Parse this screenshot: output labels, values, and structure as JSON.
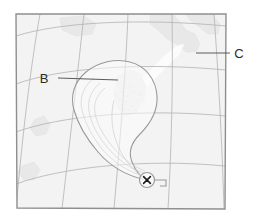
{
  "figure": {
    "kind": "tropical-cyclone-forecast-track-map",
    "width": 257,
    "height": 224,
    "background_color": "#ffffff"
  },
  "map": {
    "frame": {
      "corners": "16,14 226,14 225,209 17,208",
      "border_color": "#8f8f8f",
      "fill_color": "#f3f3f3"
    },
    "graticule": {
      "color": "#b0b0b0",
      "latitude_lines": 4,
      "longitude_lines": 5
    },
    "land": {
      "fill_color": "#e6e6e6",
      "stroke_color": "#dddddd"
    }
  },
  "storm": {
    "cone": {
      "label": "forecast uncertainty cone",
      "stroke_color": "#9a9a9a",
      "fill_color": "#fbfbfb"
    },
    "current_position": {
      "marker": "x-in-circle",
      "x": 147,
      "y": 180,
      "circle_color": "#9a9a9a",
      "x_color": "#1a1a1a"
    },
    "callout_bracket": {
      "color": "#9a9a9a"
    }
  },
  "annotations": [
    {
      "id": "annotation-b",
      "label": "B",
      "text_x": 44,
      "text_y": 83,
      "leader": "58,78 L 118,80",
      "leader_color": "#4a4a4a"
    },
    {
      "id": "annotation-c",
      "label": "C",
      "text_x": 236,
      "text_y": 58,
      "leader": "230,53 L 196,53",
      "leader_color": "#4a4a4a"
    }
  ]
}
